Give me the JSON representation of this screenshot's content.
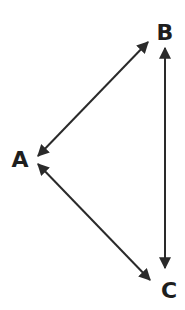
{
  "diagram": {
    "type": "graph",
    "colors": {
      "stroke": "#2a2a2a",
      "label": "#1e1e1e",
      "background": "#ffffff"
    },
    "nodes": [
      {
        "id": "A",
        "label": "A",
        "x": 20,
        "y": 167
      },
      {
        "id": "B",
        "label": "B",
        "x": 165,
        "y": 40
      },
      {
        "id": "C",
        "label": "C",
        "x": 169,
        "y": 298
      }
    ],
    "edges": [
      {
        "from": "A",
        "to": "B",
        "direction": "bidirectional"
      },
      {
        "from": "B",
        "to": "C",
        "direction": "bidirectional"
      },
      {
        "from": "A",
        "to": "C",
        "direction": "bidirectional"
      }
    ]
  }
}
